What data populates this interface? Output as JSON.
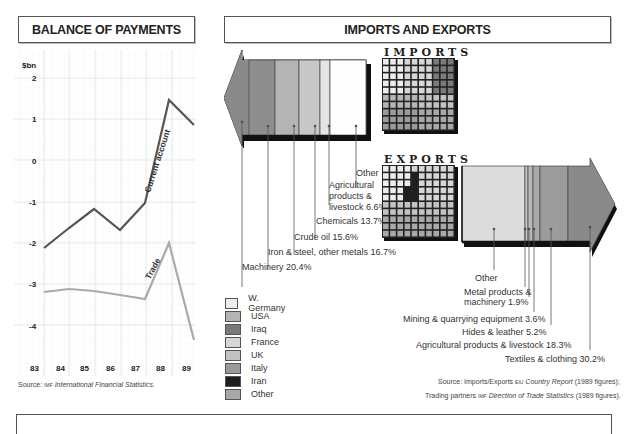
{
  "balance": {
    "title": "BALANCE OF PAYMENTS",
    "unit": "$bn",
    "source_prefix": "Source:",
    "source_agency": "IMF",
    "source_title": "International Financial Statistics."
  },
  "trade": {
    "title": "IMPORTS AND EXPORTS",
    "imports_label": "IMPORTS",
    "exports_label": "EXPORTS",
    "source_line1_prefix": "Source: Imports/Exports",
    "source_line1_agency": "EIU",
    "source_line1_title": "Country Report",
    "source_line1_suffix": "(1989 figures);",
    "source_line2_prefix": "Trading partners",
    "source_line2_agency": "IMF",
    "source_line2_title": "Direction of Trade Statistics",
    "source_line2_suffix": "(1989 figures)."
  },
  "chart_data": [
    {
      "type": "line",
      "title": "BALANCE OF PAYMENTS",
      "xlabel": "",
      "ylabel": "$bn",
      "x": [
        "83",
        "84",
        "85",
        "86",
        "87",
        "88",
        "89"
      ],
      "yticks": [
        2,
        1,
        0,
        -1,
        -2,
        -3,
        -4
      ],
      "ylim": [
        -4.6,
        2.4
      ],
      "grid": true,
      "series": [
        {
          "name": "Current account",
          "values": [
            -2.1,
            -1.6,
            -1.2,
            -1.7,
            -0.9,
            1.5,
            0.9
          ],
          "color": "#555555"
        },
        {
          "name": "Trade",
          "values": [
            -3.15,
            -3.05,
            -3.1,
            -3.2,
            -3.35,
            -2.0,
            -4.3
          ],
          "color": "#aaaaaa"
        }
      ]
    },
    {
      "type": "bar",
      "title": "IMPORTS",
      "orientation": "stacked-horizontal-arrow",
      "categories": [
        "Machinery",
        "Iron & steel, other metals",
        "Crude oil",
        "Chemicals",
        "Agricultural products & livestock",
        "Other"
      ],
      "values": [
        20.4,
        16.7,
        15.6,
        13.7,
        6.6,
        27.0
      ],
      "labels": [
        "Machinery 20.4%",
        "Iron & steel, other metals 16.7%",
        "Crude oil 15.6%",
        "Chemicals 13.7%",
        "Agricultural products & livestock 6.6%",
        "Other"
      ]
    },
    {
      "type": "bar",
      "title": "EXPORTS",
      "orientation": "stacked-horizontal-arrow",
      "categories": [
        "Other",
        "Metal products & machinery",
        "Mining & quarrying equipment",
        "Hides & leather",
        "Agricultural products & livestock",
        "Textiles & clothing"
      ],
      "values": [
        40.8,
        1.9,
        3.6,
        5.2,
        18.3,
        30.2
      ],
      "labels": [
        "Other",
        "Metal products & machinery 1.9%",
        "Mining & quarrying equipment 3.6%",
        "Hides & leather 5.2%",
        "Agricultural products & livestock 18.3%",
        "Textiles & clothing 30.2%"
      ]
    },
    {
      "type": "heatmap",
      "title": "Trading partners (10x10 grid, 100 cells = 100%)",
      "legend": [
        {
          "name": "W. Germany",
          "color": "#ececec"
        },
        {
          "name": "USA",
          "color": "#b4b4b4"
        },
        {
          "name": "Iraq",
          "color": "#7a7a7a"
        },
        {
          "name": "France",
          "color": "#d6d6d6"
        },
        {
          "name": "UK",
          "color": "#c2c2c2"
        },
        {
          "name": "Italy",
          "color": "#9a9a9a"
        },
        {
          "name": "Iran",
          "color": "#1e1e1e"
        },
        {
          "name": "Other",
          "color": "#a8a8a8"
        }
      ]
    }
  ],
  "legend": [
    {
      "label": "W. Germany",
      "color": "#ececec"
    },
    {
      "label": "USA",
      "color": "#b4b4b4"
    },
    {
      "label": "Iraq",
      "color": "#7a7a7a"
    },
    {
      "label": "France",
      "color": "#d6d6d6"
    },
    {
      "label": "UK",
      "color": "#c2c2c2"
    },
    {
      "label": "Italy",
      "color": "#9a9a9a"
    },
    {
      "label": "Iran",
      "color": "#1e1e1e"
    },
    {
      "label": "Other",
      "color": "#a8a8a8"
    }
  ],
  "import_labels": {
    "other": "Other",
    "agri1": "Agricultural",
    "agri2": "products &",
    "agri3": "livestock 6.6%",
    "chem": "Chemicals 13.7%",
    "crude": "Crude oil 15.6%",
    "iron": "Iron & steel, other metals 16.7%",
    "mach": "Machinery 20.4%"
  },
  "export_labels": {
    "other": "Other",
    "metal1": "Metal products &",
    "metal2": "machinery 1.9%",
    "mining": "Mining & quarrying equipment 3.6%",
    "hides": "Hides & leather 5.2%",
    "agri": "Agricultural products & livestock 18.3%",
    "textiles": "Textiles & clothing 30.2%"
  }
}
